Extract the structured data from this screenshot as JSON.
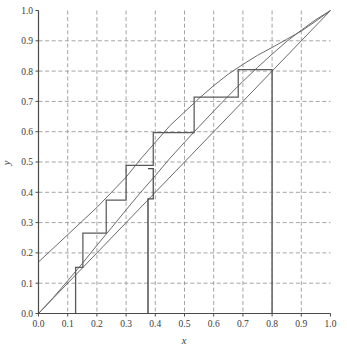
{
  "chart_data": {
    "type": "line",
    "title": "",
    "xlabel": "x",
    "ylabel": "y",
    "xlim": [
      0.0,
      1.0
    ],
    "ylim": [
      0.0,
      1.0
    ],
    "grid": true,
    "grid_style": "dashed",
    "legend": "none",
    "xticks": [
      "0.0",
      "0.1",
      "0.2",
      "0.3",
      "0.4",
      "0.5",
      "0.6",
      "0.7",
      "0.8",
      "0.9",
      "1.0"
    ],
    "yticks": [
      "0.0",
      "0.1",
      "0.2",
      "0.3",
      "0.4",
      "0.5",
      "0.6",
      "0.7",
      "0.8",
      "0.9",
      "1.0"
    ],
    "xtick_values": [
      0.0,
      0.1,
      0.2,
      0.3,
      0.4,
      0.5,
      0.6,
      0.7,
      0.8,
      0.9,
      1.0
    ],
    "ytick_values": [
      0.0,
      0.1,
      0.2,
      0.3,
      0.4,
      0.5,
      0.6,
      0.7,
      0.8,
      0.9,
      1.0
    ],
    "series": [
      {
        "name": "upper-curve",
        "type": "line",
        "color": "#6b6b6b",
        "points": [
          [
            0.0,
            0.17
          ],
          [
            0.05,
            0.215
          ],
          [
            0.1,
            0.26
          ],
          [
            0.15,
            0.305
          ],
          [
            0.2,
            0.35
          ],
          [
            0.25,
            0.4
          ],
          [
            0.3,
            0.45
          ],
          [
            0.35,
            0.51
          ],
          [
            0.4,
            0.565
          ],
          [
            0.45,
            0.62
          ],
          [
            0.5,
            0.665
          ],
          [
            0.55,
            0.71
          ],
          [
            0.6,
            0.752
          ],
          [
            0.65,
            0.79
          ],
          [
            0.7,
            0.822
          ],
          [
            0.75,
            0.852
          ],
          [
            0.8,
            0.878
          ],
          [
            0.85,
            0.905
          ],
          [
            0.9,
            0.932
          ],
          [
            0.95,
            0.965
          ],
          [
            1.0,
            1.0
          ]
        ]
      },
      {
        "name": "lower-curve",
        "type": "line",
        "color": "#6b6b6b",
        "points": [
          [
            0.0,
            0.0
          ],
          [
            0.05,
            0.052
          ],
          [
            0.1,
            0.108
          ],
          [
            0.15,
            0.165
          ],
          [
            0.2,
            0.225
          ],
          [
            0.25,
            0.283
          ],
          [
            0.3,
            0.342
          ],
          [
            0.35,
            0.4
          ],
          [
            0.4,
            0.455
          ],
          [
            0.45,
            0.512
          ],
          [
            0.5,
            0.565
          ],
          [
            0.55,
            0.617
          ],
          [
            0.6,
            0.668
          ],
          [
            0.65,
            0.718
          ],
          [
            0.7,
            0.766
          ],
          [
            0.75,
            0.812
          ],
          [
            0.8,
            0.856
          ],
          [
            0.85,
            0.898
          ],
          [
            0.9,
            0.935
          ],
          [
            0.95,
            0.97
          ],
          [
            1.0,
            1.0
          ]
        ]
      },
      {
        "name": "identity-line",
        "type": "line",
        "color": "#6b6b6b",
        "points": [
          [
            0.0,
            0.0
          ],
          [
            1.0,
            1.0
          ]
        ]
      },
      {
        "name": "cobweb-staircase",
        "type": "step",
        "color": "#5a5a5a",
        "points": [
          [
            0.127,
            0.0
          ],
          [
            0.127,
            0.152
          ],
          [
            0.152,
            0.152
          ],
          [
            0.152,
            0.265
          ],
          [
            0.232,
            0.265
          ],
          [
            0.232,
            0.374
          ],
          [
            0.3,
            0.374
          ],
          [
            0.3,
            0.489
          ],
          [
            0.393,
            0.489
          ],
          [
            0.393,
            0.597
          ],
          [
            0.533,
            0.597
          ],
          [
            0.533,
            0.714
          ],
          [
            0.684,
            0.714
          ],
          [
            0.684,
            0.805
          ],
          [
            0.8,
            0.805
          ],
          [
            0.8,
            0.0
          ]
        ]
      },
      {
        "name": "cobweb-descending",
        "type": "step",
        "color": "#4a4a4a",
        "points": [
          [
            0.375,
            0.0
          ],
          [
            0.375,
            0.378
          ],
          [
            0.393,
            0.378
          ],
          [
            0.393,
            0.478
          ],
          [
            0.375,
            0.478
          ]
        ]
      }
    ],
    "fixed_points": [
      [
        0.8,
        0.8
      ],
      [
        1.0,
        1.0
      ],
      [
        0.0,
        0.0
      ]
    ],
    "annotations": []
  },
  "axes": {
    "x_title": "x",
    "y_title": "y"
  },
  "colors": {
    "curve": "#6b6b6b",
    "cobweb": "#5a5a5a",
    "grid": "#9a9a9a",
    "axis": "#4a4a4a",
    "guide": "#a8a8a8",
    "background": "#ffffff"
  }
}
